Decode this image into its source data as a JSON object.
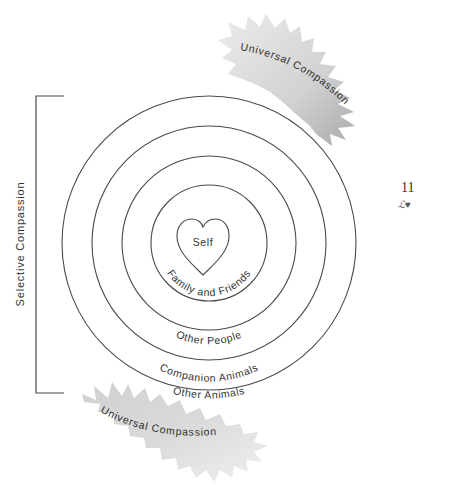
{
  "diagram": {
    "rings": [
      {
        "label": "Self",
        "shape": "heart"
      },
      {
        "label": "Family and Friends"
      },
      {
        "label": "Other People"
      },
      {
        "label": "Companion Animals"
      },
      {
        "label": "Other Animals"
      }
    ],
    "bracket_label": "Selective Compassion",
    "bursts": [
      {
        "position": "top-right",
        "label": "Universal Compassion"
      },
      {
        "position": "bottom-left",
        "label": "Universal Compassion"
      }
    ],
    "colors": {
      "line": "#4a4a4a",
      "burst_fill_light": "#e6e6e6",
      "burst_fill_dark": "#b0b0b0",
      "text": "#333333"
    }
  },
  "page": {
    "number": "11",
    "ornament": "ℒ♥"
  }
}
